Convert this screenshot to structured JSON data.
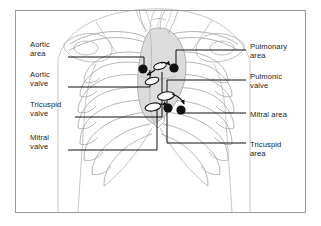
{
  "figure": {
    "kind": "anatomical-line-diagram",
    "frame": {
      "border_color": "#9a9a9a",
      "background": "#ffffff"
    },
    "colors": {
      "outline": "#b9b9b9",
      "ribs": "#a8a8a8",
      "heart_fill": "#dcdcdc",
      "heart_outline": "#9e9e9e",
      "marker_dot": "#111111",
      "valve_fill": "#ffffff",
      "valve_stroke": "#111111",
      "leader_line": "#111111",
      "text": "#1b1b1b"
    }
  },
  "labels": {
    "left": [
      {
        "id": "aortic-area",
        "text": "Aortic\narea",
        "x": 30,
        "y": 40,
        "line_y": 57,
        "line_x1": 68,
        "line_x2": 144
      },
      {
        "id": "aortic-valve",
        "text": "Aortic\nvalve",
        "x": 30,
        "y": 70,
        "line_y": 87,
        "line_x1": 68,
        "line_x2": 150
      },
      {
        "id": "tricuspid-valve",
        "text": "Tricuspid\nvalve",
        "x": 30,
        "y": 100,
        "line_y": 117,
        "line_x1": 75,
        "line_x2": 162
      },
      {
        "id": "mitral-valve",
        "text": "Mitral\nvalve",
        "x": 30,
        "y": 133,
        "line_y": 150,
        "line_x1": 68,
        "line_x2": 157
      }
    ],
    "right": [
      {
        "id": "pulmonary-area",
        "text": "Pulmonary\narea",
        "x": 250,
        "y": 42,
        "line_y": 50,
        "line_x1": 176,
        "line_x2": 246
      },
      {
        "id": "pulmonic-valve",
        "text": "Pulmonic\nvalve",
        "x": 250,
        "y": 72,
        "line_y": 80,
        "line_x1": 167,
        "line_x2": 246
      },
      {
        "id": "mitral-area",
        "text": "Mitral area",
        "x": 250,
        "y": 110,
        "line_y": 113,
        "line_x1": 181,
        "line_x2": 246
      },
      {
        "id": "tricuspid-area",
        "text": "Tricuspid\narea",
        "x": 250,
        "y": 140,
        "line_y": 143,
        "line_x1": 167,
        "line_x2": 246
      }
    ]
  },
  "markers": {
    "auscultation_dots": [
      {
        "id": "aortic-area-dot",
        "cx": 143,
        "cy": 69,
        "r": 4.6
      },
      {
        "id": "pulmonary-area-dot",
        "cx": 174,
        "cy": 68,
        "r": 4.6
      },
      {
        "id": "tricuspid-area-dot",
        "cx": 168,
        "cy": 108,
        "r": 4.6
      },
      {
        "id": "mitral-area-dot",
        "cx": 181,
        "cy": 110,
        "r": 4.6
      }
    ],
    "valve_ellipses": [
      {
        "id": "aortic-valve-ellipse",
        "cx": 160,
        "cy": 66,
        "rx": 6.5,
        "ry": 3.2,
        "rot": -18
      },
      {
        "id": "pulmonic-valve-ellipse",
        "cx": 152,
        "cy": 81,
        "rx": 7.0,
        "ry": 3.4,
        "rot": -16
      },
      {
        "id": "mitral-valve-ellipse",
        "cx": 166,
        "cy": 96,
        "rx": 8.5,
        "ry": 4.0,
        "rot": -10
      },
      {
        "id": "tricuspid-valve-ellipse",
        "cx": 153,
        "cy": 107,
        "rx": 8.0,
        "ry": 3.8,
        "rot": -12
      }
    ],
    "arrows": [
      {
        "id": "arrow-aortic",
        "from": [
          155,
          70
        ],
        "to": [
          146,
          74
        ]
      },
      {
        "id": "arrow-pulmonic",
        "from": [
          160,
          64
        ],
        "to": [
          170,
          66
        ]
      },
      {
        "id": "arrow-mitral",
        "from": [
          172,
          95
        ],
        "to": [
          182,
          104
        ]
      },
      {
        "id": "arrow-tricuspid",
        "from": [
          160,
          103
        ],
        "to": [
          168,
          104
        ]
      }
    ]
  }
}
